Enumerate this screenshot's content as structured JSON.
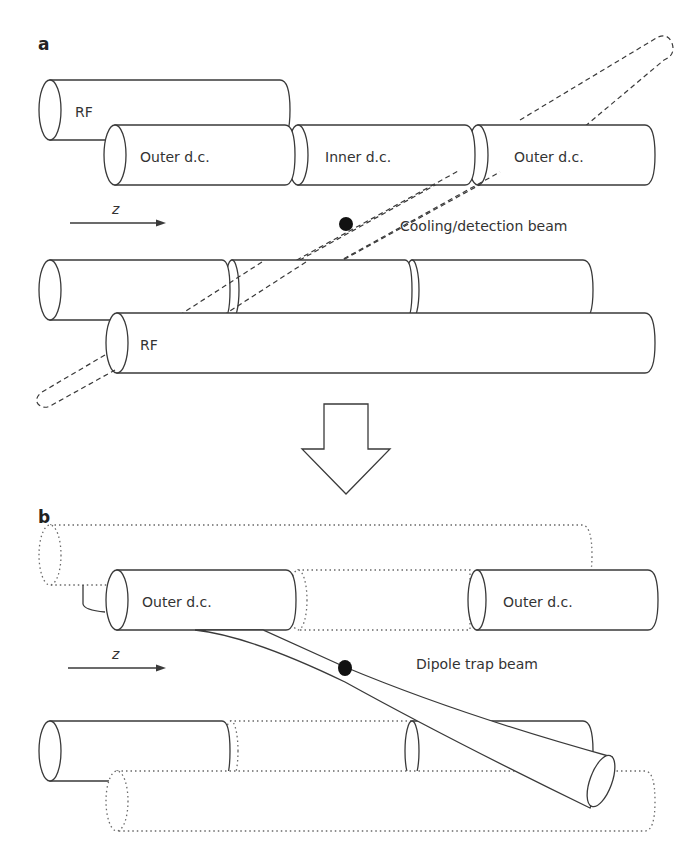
{
  "figure": {
    "panels": [
      {
        "id": "a",
        "label": "a",
        "electrodes": {
          "top_rf": "RF",
          "outer_dc_left": "Outer d.c.",
          "inner_dc": "Inner d.c.",
          "outer_dc_right": "Outer d.c.",
          "bottom_rf": "RF"
        },
        "axis_label": "z",
        "beam_label": "Cooling/detection beam",
        "beam_style": "dashed"
      },
      {
        "id": "b",
        "label": "b",
        "electrodes": {
          "outer_dc_left": "Outer d.c.",
          "outer_dc_right": "Outer d.c."
        },
        "axis_label": "z",
        "beam_label": "Dipole trap beam",
        "beam_style": "solid focused",
        "hidden_electrodes_style": "dotted"
      }
    ],
    "transition_arrow": "down-arrow",
    "colors": {
      "line": "#3a3a3a",
      "dotted": "#6a6a6a",
      "ion": "#111111",
      "background": "#ffffff"
    }
  }
}
